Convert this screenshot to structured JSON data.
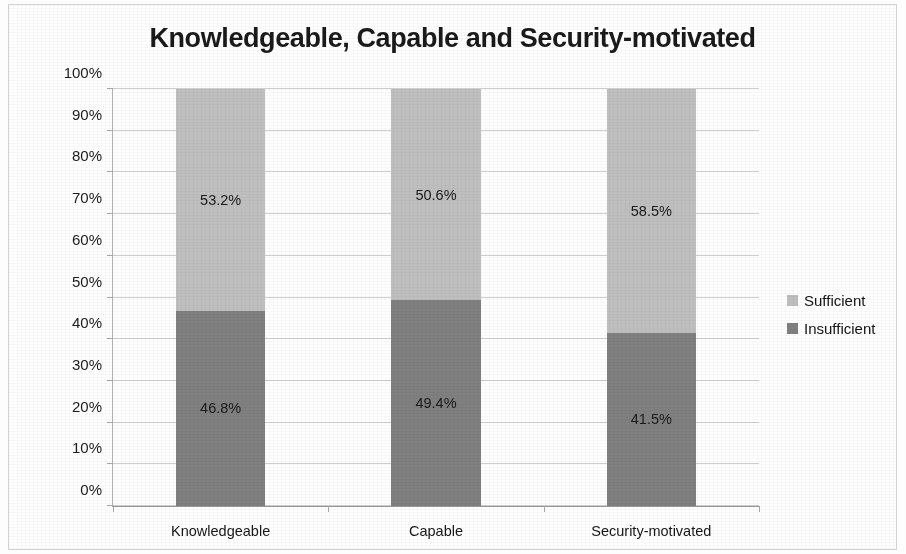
{
  "chart_data": {
    "type": "bar",
    "subtype": "stacked-bar-100",
    "title": "Knowledgeable, Capable and Security-motivated",
    "xlabel": "",
    "ylabel": "",
    "ylim": [
      0,
      100
    ],
    "y_unit": "%",
    "grid": true,
    "legend_position": "right",
    "categories": [
      "Knowledgeable",
      "Capable",
      "Security-motivated"
    ],
    "tick_labels": [
      "0%",
      "10%",
      "20%",
      "30%",
      "40%",
      "50%",
      "60%",
      "70%",
      "80%",
      "90%",
      "100%"
    ],
    "tick_values": [
      0,
      10,
      20,
      30,
      40,
      50,
      60,
      70,
      80,
      90,
      100
    ],
    "series": [
      {
        "name": "Insufficient",
        "color": "#808080",
        "values": [
          46.8,
          49.4,
          41.5
        ],
        "data_labels": [
          "46.8%",
          "49.4%",
          "41.5%"
        ]
      },
      {
        "name": "Sufficient",
        "color": "#bfbfbf",
        "values": [
          53.2,
          50.6,
          58.5
        ],
        "data_labels": [
          "53.2%",
          "50.6%",
          "58.5%"
        ]
      }
    ],
    "legend_entries": [
      {
        "label": "Sufficient",
        "color": "#bfbfbf"
      },
      {
        "label": "Insufficient",
        "color": "#808080"
      }
    ]
  }
}
